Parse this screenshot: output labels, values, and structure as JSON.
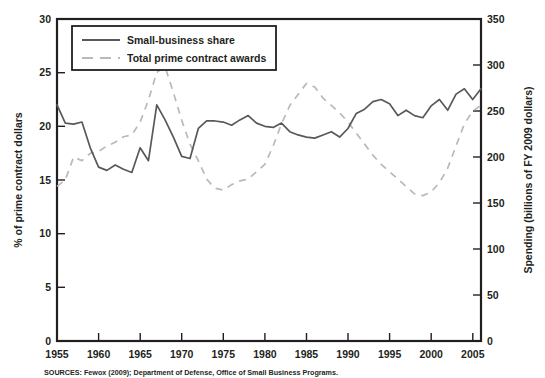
{
  "figure": {
    "source_note": "SOURCES: Fewox (2009); Department of Defense, Office of Small Business Programs."
  },
  "legend": {
    "position": "top-left-inside",
    "entries": [
      {
        "label": "Small-business share",
        "style": "solid",
        "color": "#58595b"
      },
      {
        "label": "Total prime contract awards",
        "style": "dashed",
        "color": "#b7b9bb"
      }
    ]
  },
  "axes": {
    "left": {
      "title": "% of prime contract dollars",
      "ticks": [
        "0",
        "5",
        "10",
        "15",
        "20",
        "25",
        "30"
      ],
      "min": 0,
      "max": 30
    },
    "right": {
      "title": "Spending (billions of FY 2009 dollars)",
      "ticks": [
        "0",
        "50",
        "100",
        "150",
        "200",
        "250",
        "300",
        "350"
      ],
      "min": 0,
      "max": 350
    },
    "bottom": {
      "title": "",
      "ticks": [
        "1955",
        "1960",
        "1965",
        "1970",
        "1975",
        "1980",
        "1985",
        "1990",
        "1995",
        "2000",
        "2005"
      ],
      "min": 1955,
      "max": 2006
    }
  },
  "chart_data": {
    "type": "line",
    "title": "",
    "xlabel": "",
    "ylabel": "% of prime contract dollars",
    "y2label": "Spending (billions of FY 2009 dollars)",
    "xlim": [
      1955,
      2006
    ],
    "ylim": [
      0,
      30
    ],
    "y2lim": [
      0,
      350
    ],
    "grid": false,
    "legend_position": "upper left",
    "x": [
      1955,
      1956,
      1957,
      1958,
      1959,
      1960,
      1961,
      1962,
      1963,
      1964,
      1965,
      1966,
      1967,
      1968,
      1969,
      1970,
      1971,
      1972,
      1973,
      1974,
      1975,
      1976,
      1977,
      1978,
      1979,
      1980,
      1981,
      1982,
      1983,
      1984,
      1985,
      1986,
      1987,
      1988,
      1989,
      1990,
      1991,
      1992,
      1993,
      1994,
      1995,
      1996,
      1997,
      1998,
      1999,
      2000,
      2001,
      2002,
      2003,
      2004,
      2005,
      2006
    ],
    "series": [
      {
        "name": "Small-business share",
        "axis": "left",
        "units": "% of prime contract dollars",
        "style": "solid",
        "color": "#58595b",
        "values": [
          22.0,
          20.3,
          20.2,
          20.4,
          18.0,
          16.2,
          15.9,
          16.4,
          16.0,
          15.7,
          18.0,
          16.8,
          22.0,
          20.6,
          19.0,
          17.2,
          17.0,
          19.8,
          20.5,
          20.5,
          20.4,
          20.1,
          20.6,
          21.0,
          20.3,
          20.0,
          19.9,
          20.3,
          19.5,
          19.2,
          19.0,
          18.9,
          19.2,
          19.5,
          19.0,
          19.8,
          21.2,
          21.6,
          22.3,
          22.5,
          22.1,
          21.0,
          21.5,
          21.0,
          20.8,
          21.9,
          22.5,
          21.5,
          23.0,
          23.5,
          22.5,
          23.5
        ]
      },
      {
        "name": "Total prime contract awards",
        "axis": "right",
        "units": "billions of FY 2009 dollars",
        "style": "dashed",
        "color": "#b7b9bb",
        "values": [
          168,
          175,
          200,
          196,
          204,
          206,
          212,
          216,
          222,
          224,
          238,
          262,
          292,
          298,
          270,
          240,
          214,
          196,
          176,
          166,
          164,
          170,
          174,
          176,
          184,
          192,
          212,
          236,
          256,
          268,
          280,
          276,
          264,
          256,
          248,
          238,
          226,
          214,
          202,
          192,
          184,
          176,
          168,
          160,
          158,
          162,
          172,
          188,
          212,
          236,
          250,
          256
        ]
      }
    ]
  }
}
